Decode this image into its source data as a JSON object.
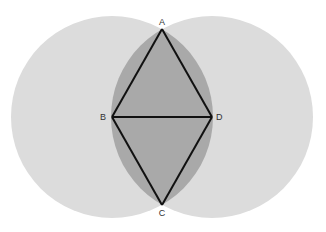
{
  "diagram": {
    "type": "geometric-construction",
    "colors": {
      "background": "#ffffff",
      "circle_fill": "#dcdcdc",
      "lens_fill": "#a9a9a9",
      "line": "#111111",
      "label": "#333333"
    },
    "circles": [
      {
        "name": "left-circle",
        "cx": 112,
        "cy": 117,
        "r": 101
      },
      {
        "name": "right-circle",
        "cx": 212,
        "cy": 117,
        "r": 101
      }
    ],
    "points": {
      "A": {
        "label": "A",
        "x": 162,
        "y": 29
      },
      "B": {
        "label": "B",
        "x": 112,
        "y": 117
      },
      "C": {
        "label": "C",
        "x": 162,
        "y": 205
      },
      "D": {
        "label": "D",
        "x": 212,
        "y": 117
      }
    },
    "segments": [
      "AB",
      "AD",
      "BD",
      "BC",
      "DC"
    ]
  }
}
